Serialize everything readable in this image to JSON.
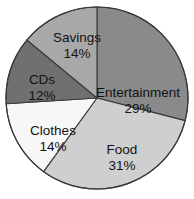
{
  "chart_data": {
    "type": "pie",
    "title": "",
    "subtitle": "",
    "xlabel": "",
    "ylabel": "",
    "legend_position": "none",
    "grid": false,
    "labels_inside_slices": true,
    "value_unit": "%",
    "start_angle_deg": 0,
    "direction": "clockwise",
    "categories": [
      "Entertainment",
      "Food",
      "Clothes",
      "CDs",
      "Savings"
    ],
    "values": [
      29,
      31,
      14,
      12,
      14
    ],
    "slices": [
      {
        "name": "Entertainment",
        "value": 29,
        "value_text": "29%",
        "color": "#8a8a8a",
        "label_x": 138,
        "label_y": 93
      },
      {
        "name": "Food",
        "value": 31,
        "value_text": "31%",
        "color": "#cfcfcf",
        "label_x": 122,
        "label_y": 150
      },
      {
        "name": "Clothes",
        "value": 14,
        "value_text": "14%",
        "color": "#f7f7f7",
        "label_x": 53,
        "label_y": 131
      },
      {
        "name": "CDs",
        "value": 12,
        "value_text": "12%",
        "color": "#707070",
        "label_x": 42,
        "label_y": 80
      },
      {
        "name": "Savings",
        "value": 14,
        "value_text": "14%",
        "color": "#a8a8a8",
        "label_x": 77,
        "label_y": 38
      }
    ]
  },
  "geometry": {
    "center_x": 97,
    "center_y": 98,
    "radius": 91,
    "outline_color": "#3a3a3a",
    "background_color": "#ffffff",
    "label_text_color": "#131313"
  }
}
